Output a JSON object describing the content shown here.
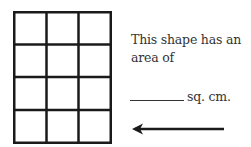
{
  "figure": {
    "shape": "rectangle grid",
    "columns": 3,
    "rows": 4,
    "line_color": "#1a1a1a"
  },
  "prompt": {
    "line1": "This shape has an",
    "line2": "area of",
    "unit": "sq. cm.",
    "blank_placeholder": "________"
  },
  "arrow": {
    "direction": "left",
    "icon": "arrow-left-icon",
    "color": "#1a1a1a"
  }
}
